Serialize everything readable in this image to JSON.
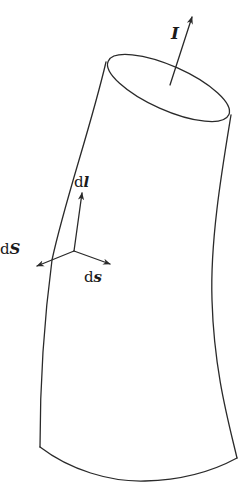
{
  "figure": {
    "stroke_color": "#2a2a2a",
    "background": "#ffffff"
  },
  "labels": {
    "current": {
      "text": "I"
    },
    "dl": {
      "prefix": "d",
      "symbol": "l"
    },
    "dS": {
      "prefix": "d",
      "symbol": "S"
    },
    "ds": {
      "prefix": "d",
      "symbol": "s"
    }
  },
  "vectors": [
    {
      "name": "I",
      "from": [
        170,
        85
      ],
      "to": [
        192,
        17
      ]
    },
    {
      "name": "dl",
      "from": [
        74,
        251
      ],
      "to": [
        82,
        193
      ]
    },
    {
      "name": "dS",
      "from": [
        74,
        251
      ],
      "to": [
        37,
        266
      ]
    },
    {
      "name": "ds",
      "from": [
        74,
        251
      ],
      "to": [
        110,
        264
      ]
    }
  ]
}
